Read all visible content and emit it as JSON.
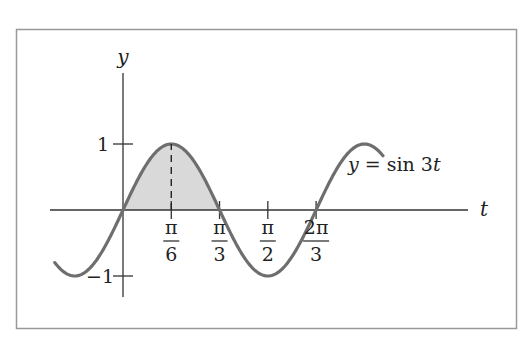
{
  "chart_data": {
    "type": "line",
    "title": "",
    "equation_label": "y = sin 3t",
    "xlabel": "t",
    "ylabel": "y",
    "x_ticks": [
      {
        "value": 0.5236,
        "num": "π",
        "den": "6"
      },
      {
        "value": 1.0472,
        "num": "π",
        "den": "3"
      },
      {
        "value": 1.5708,
        "num": "π",
        "den": "2"
      },
      {
        "value": 2.0944,
        "num": "2π",
        "den": "3"
      }
    ],
    "y_ticks": [
      {
        "value": 1,
        "label": "1"
      },
      {
        "value": -1,
        "label": "−1"
      }
    ],
    "xlim": [
      -0.74,
      2.82
    ],
    "ylim": [
      -1,
      1
    ],
    "series": [
      {
        "name": "y = sin 3t",
        "function": "sin(3t)",
        "t_range": [
          -0.74,
          2.82
        ]
      }
    ],
    "shaded_region": {
      "from": 0,
      "to": 1.0472,
      "description": "area under curve between 0 and π/3"
    },
    "dashed_line": {
      "t": 0.5236,
      "from_y": 0,
      "to_y": 1
    },
    "grid": false,
    "legend": "none"
  },
  "labels": {
    "y_axis": "y",
    "t_axis": "t",
    "equation": "y = sin 3t",
    "y_tick_1": "1",
    "y_tick_neg1": "−1"
  }
}
